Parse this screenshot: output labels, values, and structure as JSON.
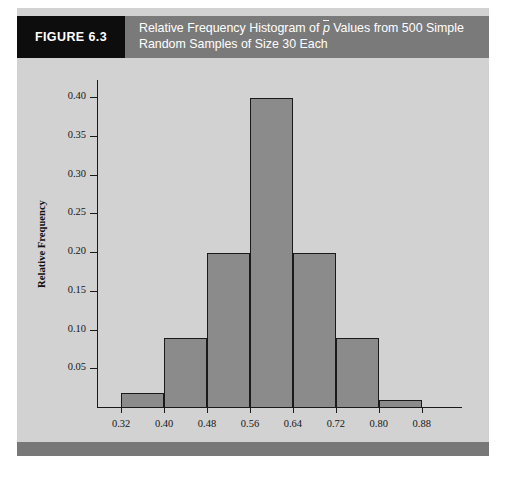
{
  "figure": {
    "tag": "FIGURE 6.3",
    "title_line1_prefix": "Relative Frequency Histogram of ",
    "title_symbol": "p",
    "title_line1_suffix": " Values from 500 Simple",
    "title_line2": "Random Samples of Size 30 Each",
    "background_color": "#d2d2d2",
    "header_color": "#7a7a7a",
    "tag_color": "#0d0d0d",
    "footer_color": "#787878"
  },
  "chart_data": {
    "type": "bar",
    "xlabel": "Values of p̄",
    "ylabel": "Relative Frequency",
    "bin_edges": [
      0.32,
      0.4,
      0.48,
      0.56,
      0.64,
      0.72,
      0.8,
      0.88
    ],
    "categories": [
      "0.32-0.40",
      "0.40-0.48",
      "0.48-0.56",
      "0.56-0.64",
      "0.64-0.72",
      "0.72-0.80",
      "0.80-0.88"
    ],
    "values": [
      0.02,
      0.09,
      0.2,
      0.4,
      0.2,
      0.09,
      0.01
    ],
    "xtick_labels": [
      "0.32",
      "0.40",
      "0.48",
      "0.56",
      "0.64",
      "0.72",
      "0.80",
      "0.88"
    ],
    "ytick_labels": [
      "0.05",
      "0.10",
      "0.15",
      "0.20",
      "0.25",
      "0.30",
      "0.35",
      "0.40"
    ],
    "ytick_values": [
      0.05,
      0.1,
      0.15,
      0.2,
      0.25,
      0.3,
      0.35,
      0.4
    ],
    "ylim": [
      0,
      0.4235
    ],
    "xlim": [
      0.275,
      0.955
    ],
    "grid": false,
    "legend": false,
    "bar_fill_color": "#8b8b8b",
    "bar_edge_color": "#1a1a1a",
    "sample_count": 500,
    "sample_size": 30
  }
}
